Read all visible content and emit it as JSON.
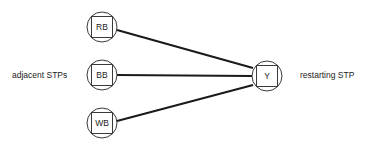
{
  "diagram": {
    "background_color": "#ffffff",
    "edge_color": "#1a1a1a",
    "node_stroke_color": "#3a3a3a",
    "node_fill_color": "#ffffff",
    "text_color": "#222222",
    "labels": {
      "left": "adjacent STPs",
      "right": "restarting STP"
    },
    "nodes": [
      {
        "id": "RB",
        "label": "RB",
        "cx": 102,
        "cy": 27,
        "r": 15,
        "square": 21
      },
      {
        "id": "BB",
        "label": "BB",
        "cx": 102,
        "cy": 75,
        "r": 15,
        "square": 21
      },
      {
        "id": "WB",
        "label": "WB",
        "cx": 102,
        "cy": 123,
        "r": 15,
        "square": 21
      },
      {
        "id": "Y",
        "label": "Y",
        "cx": 267,
        "cy": 76,
        "r": 15,
        "square": 21
      }
    ],
    "edges": [
      {
        "id": "rb-y",
        "from": "RB",
        "to": "Y",
        "x1": 117,
        "y1": 30,
        "x2": 253,
        "y2": 68
      },
      {
        "id": "bb-y",
        "from": "BB",
        "to": "Y",
        "x1": 117,
        "y1": 75,
        "x2": 252,
        "y2": 76
      },
      {
        "id": "wb-y",
        "from": "WB",
        "to": "Y",
        "x1": 117,
        "y1": 121,
        "x2": 253,
        "y2": 85
      }
    ]
  }
}
